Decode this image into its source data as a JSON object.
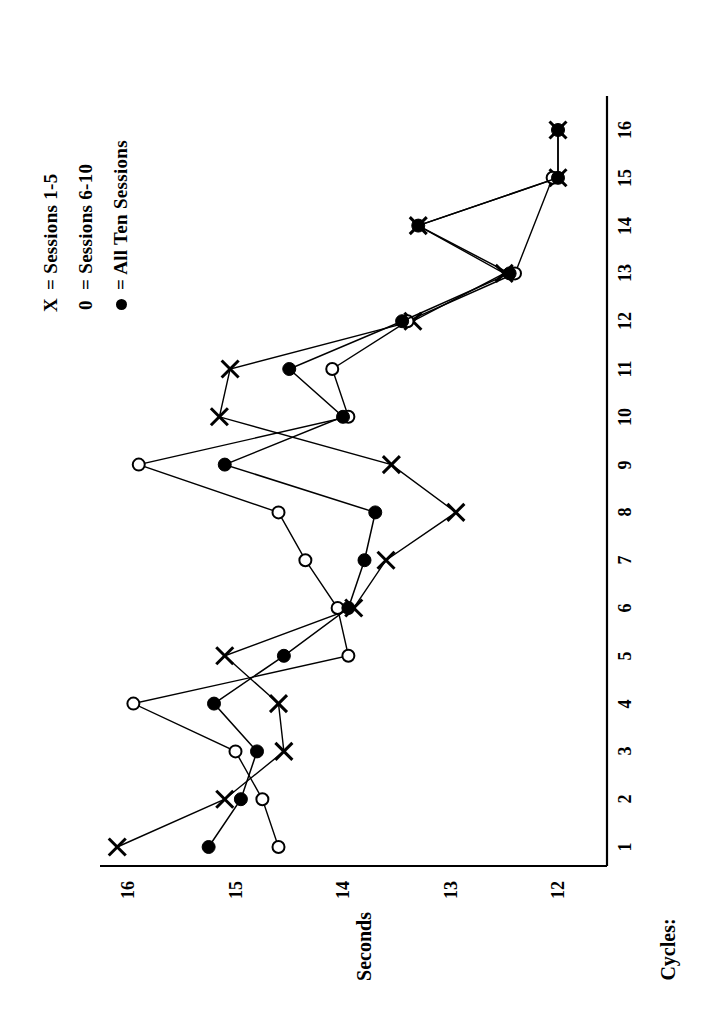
{
  "figure": {
    "orientation": "rotated-90-ccw",
    "background": "#ffffff",
    "ink": "#000000"
  },
  "legend": {
    "position": "top-left",
    "items": [
      {
        "key": "X",
        "symbol": "x-marker",
        "equals": "=",
        "label": "Sessions 1-5"
      },
      {
        "key": "0",
        "symbol": "open-circle-marker",
        "equals": "=",
        "label": "Sessions 6-10"
      },
      {
        "key": "",
        "symbol": "filled-circle-marker",
        "equals": "=",
        "label": "All Ten Sessions"
      }
    ]
  },
  "axes": {
    "cycles_label": "Cycles:",
    "seconds_label": "Seconds",
    "cycle_ticks": [
      "1",
      "2",
      "3",
      "4",
      "5",
      "6",
      "7",
      "8",
      "9",
      "10",
      "11",
      "12",
      "13",
      "14",
      "15",
      "16"
    ],
    "seconds_ticks": [
      "16",
      "15",
      "14",
      "13",
      "12"
    ]
  },
  "chart_data": {
    "type": "line",
    "title": "",
    "subtitle": "",
    "xlabel": "Cycles:",
    "ylabel": "Seconds",
    "xlim": [
      1,
      16
    ],
    "ylim": [
      12,
      16
    ],
    "grid": false,
    "legend_position": "top-left",
    "categories": [
      1,
      2,
      3,
      4,
      5,
      6,
      7,
      8,
      9,
      10,
      11,
      12,
      13,
      14,
      15,
      16
    ],
    "x": [
      1,
      2,
      3,
      4,
      5,
      6,
      7,
      8,
      9,
      10,
      11,
      12,
      13,
      14,
      15,
      16
    ],
    "series": [
      {
        "name": "Sessions 1-5",
        "marker": "x",
        "values": [
          16.1,
          15.1,
          14.55,
          14.6,
          15.1,
          13.9,
          13.6,
          12.95,
          13.55,
          15.15,
          15.05,
          13.35,
          12.5,
          13.3,
          12.0,
          12.0
        ]
      },
      {
        "name": "Sessions 6-10",
        "marker": "open-circle",
        "values": [
          14.6,
          14.75,
          15.0,
          15.95,
          13.95,
          14.05,
          14.35,
          14.6,
          15.9,
          13.95,
          14.1,
          13.4,
          12.4,
          null,
          12.05,
          null
        ]
      },
      {
        "name": "All Ten Sessions",
        "marker": "filled-circle",
        "values": [
          15.25,
          14.95,
          14.8,
          15.2,
          14.55,
          13.95,
          13.8,
          13.7,
          15.1,
          14.0,
          14.5,
          13.45,
          12.45,
          13.3,
          12.0,
          12.0
        ]
      }
    ],
    "annotations": []
  }
}
